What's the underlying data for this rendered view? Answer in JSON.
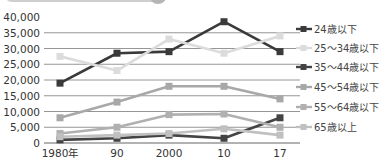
{
  "chart_data": {
    "type": "line",
    "title": "",
    "xlabel": "",
    "ylabel": "",
    "categories": [
      "1980年",
      "90",
      "2000",
      "10",
      "17"
    ],
    "x": [
      1980,
      1990,
      2000,
      2010,
      2017
    ],
    "ylim": [
      0,
      40000
    ],
    "yticks": [
      "40,000",
      "35,000",
      "30,000",
      "25,000",
      "20,000",
      "15,000",
      "10,000",
      "5,000",
      "0"
    ],
    "grid": true,
    "legend_position": "right",
    "series": [
      {
        "name": "24歳以下",
        "color": "#3a3a3a",
        "values": [
          19000,
          28500,
          29000,
          38500,
          29000
        ]
      },
      {
        "name": "25〜34歳以下",
        "color": "#dcdcdc",
        "values": [
          27500,
          23000,
          33000,
          28500,
          34000
        ]
      },
      {
        "name": "35〜44歳以下",
        "color": "#444444",
        "values": [
          1000,
          1500,
          2500,
          1500,
          8000
        ]
      },
      {
        "name": "45〜54歳以下",
        "color": "#a8a8a8",
        "values": [
          8000,
          13000,
          18000,
          18000,
          14000
        ]
      },
      {
        "name": "55〜64歳以下",
        "color": "#b0b0b0",
        "values": [
          3000,
          5000,
          9000,
          9200,
          5000
        ]
      },
      {
        "name": "65歳以上",
        "color": "#c0c0c0",
        "values": [
          2000,
          2500,
          3000,
          4500,
          2500
        ]
      }
    ]
  }
}
